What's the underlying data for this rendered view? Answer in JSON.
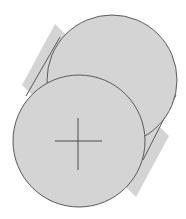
{
  "diagram": {
    "type": "cylinder-3d-view",
    "colors": {
      "fill": "#d4d4d4",
      "stroke": "#5a5a5a",
      "background": "#ffffff"
    },
    "back_face": {
      "cx": 112,
      "cy": 80,
      "r": 65
    },
    "front_face": {
      "cx": 79,
      "cy": 141,
      "r": 66
    },
    "center_mark": {
      "x": 78,
      "y": 141,
      "half_h": 23,
      "half_v": 26
    }
  }
}
